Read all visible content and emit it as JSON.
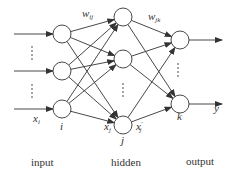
{
  "diagram": {
    "type": "neural-network",
    "layers": [
      {
        "name": "input",
        "caption": "input",
        "node_label": "i",
        "nodes": [
          {
            "x": 62,
            "y": 34
          },
          {
            "x": 62,
            "y": 71
          },
          {
            "x": 62,
            "y": 109
          }
        ]
      },
      {
        "name": "hidden",
        "caption": "hidden",
        "node_label": "j",
        "nodes": [
          {
            "x": 123,
            "y": 17
          },
          {
            "x": 123,
            "y": 59
          },
          {
            "x": 123,
            "y": 125
          }
        ]
      },
      {
        "name": "output",
        "caption": "output",
        "node_label": "k",
        "nodes": [
          {
            "x": 180,
            "y": 40
          },
          {
            "x": 180,
            "y": 104
          }
        ]
      }
    ],
    "labels": {
      "input_signal": "x",
      "input_signal_sub": "i",
      "weight_ij": "w",
      "weight_ij_sub": "ij",
      "weight_jk": "w",
      "weight_jk_sub": "jk",
      "hidden_in": "x",
      "hidden_in_sub": "j",
      "hidden_out": "x",
      "hidden_out_sub": "j",
      "hidden_out_prime": "′",
      "output_signal": "y",
      "node_i": "i",
      "node_j": "j",
      "node_k": "k"
    },
    "ellipsis": "⋮",
    "line_color": "#333333",
    "node_radius": 9
  }
}
